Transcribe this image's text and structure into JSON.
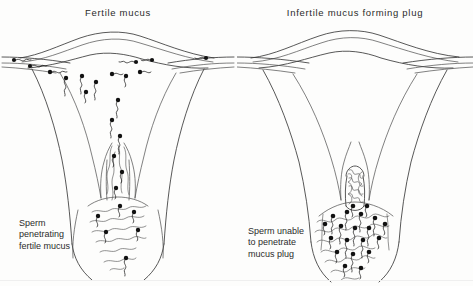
{
  "figure": {
    "type": "medical-line-illustration",
    "background_color": "#fdfdfc",
    "ink_color": "#2b2b2b",
    "panel_count": 2
  },
  "panels": [
    {
      "id": "fertile",
      "title": "Fertile  mucus",
      "caption": "Sperm\npenetrating\nfertile mucus",
      "caption_lines": [
        "Sperm",
        "penetrating",
        "fertile mucus"
      ],
      "sperm_present_in_uterus": true,
      "sperm_present_in_tubes": true,
      "cervical_canal_state": "open, threaded with watery mucus strands",
      "sperm_count_visible": 30
    },
    {
      "id": "infertile",
      "title": "Infertile  mucus  forming  plug",
      "caption": "Sperm unable\nto penetrate\nmucus plug",
      "caption_lines": [
        "Sperm unable",
        "to penetrate",
        "mucus plug"
      ],
      "sperm_present_in_uterus": false,
      "sperm_present_in_tubes": false,
      "cervical_canal_state": "blocked by dense coiled mucus plug",
      "sperm_count_visible": 28
    }
  ],
  "anatomy_labels": [
    "fallopian tube",
    "uterine fundus",
    "uterine cavity",
    "cervical canal",
    "vagina"
  ]
}
